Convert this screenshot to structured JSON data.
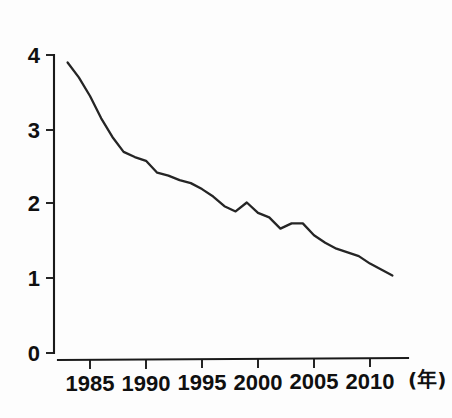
{
  "chart_data": {
    "type": "line",
    "title": "",
    "subtitle": "",
    "xlabel": "(年)",
    "ylabel": "",
    "xlim": [
      1982.5,
      2012.6
    ],
    "ylim": [
      0,
      4.15
    ],
    "grid": false,
    "legend": null,
    "x_tick_labels": [
      "1985",
      "1990",
      "1995",
      "2000",
      "2005",
      "2010"
    ],
    "x_ticks": [
      1985,
      1990,
      1995,
      2000,
      2005,
      2010
    ],
    "y_tick_labels": [
      "0",
      "1",
      "2",
      "3",
      "4"
    ],
    "y_ticks": [
      0,
      1,
      2,
      3,
      4
    ],
    "series": [
      {
        "name": "series-1",
        "color": "#252525",
        "x": [
          1983,
          1984,
          1985,
          1986,
          1987,
          1988,
          1989,
          1990,
          1991,
          1992,
          1993,
          1994,
          1995,
          1996,
          1997,
          1998,
          1999,
          2000,
          2001,
          2002,
          2003,
          2004,
          2005,
          2006,
          2007,
          2008,
          2009,
          2010,
          2011,
          2012
        ],
        "values": [
          3.9,
          3.7,
          3.45,
          3.15,
          2.9,
          2.7,
          2.63,
          2.58,
          2.42,
          2.38,
          2.32,
          2.28,
          2.2,
          2.1,
          1.97,
          1.9,
          2.02,
          1.88,
          1.82,
          1.67,
          1.74,
          1.74,
          1.58,
          1.48,
          1.4,
          1.35,
          1.3,
          1.2,
          1.12,
          1.04
        ]
      }
    ],
    "annotations": []
  },
  "axes": {
    "x_axis_unit": "(年)",
    "y_axis_unit": ""
  },
  "colors": {
    "line": "#252525",
    "axis": "#1a1a1a",
    "background": "#fdfdfd"
  }
}
